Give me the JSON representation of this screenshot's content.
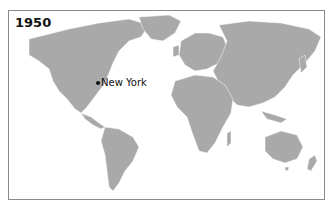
{
  "map": {
    "year_label": "1950",
    "land_color": "#a9a9a9",
    "border_color": "#ffffff",
    "ocean_color": "#ffffff",
    "cities": [
      {
        "name": "New York",
        "dot_x": 89,
        "dot_y": 72,
        "label_x": 93,
        "label_y": 66
      }
    ]
  }
}
